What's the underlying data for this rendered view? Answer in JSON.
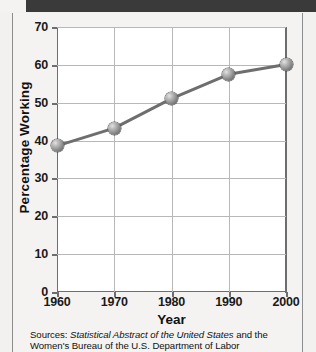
{
  "header": {
    "bar_color": "#3a3a3a"
  },
  "figure": {
    "background": "#f4f3f1",
    "plot_background": "#ffffff",
    "gridline_color": "#b8b8b8",
    "axis_color": "#6e6e6e",
    "series_color": "#6e6e6e",
    "marker_color": "#8f8f8f"
  },
  "source": {
    "prefix": "Sources: ",
    "italic_title": "Statistical Abstract of the United States",
    "suffix": " and the Women's Bureau of the U.S. Department of Labor"
  },
  "chart_data": {
    "type": "line",
    "title": "",
    "xlabel": "Year",
    "ylabel": "Percentage Working",
    "x": [
      1960,
      1970,
      1980,
      1990,
      2000
    ],
    "xticklabels": [
      "1960",
      "1970",
      "1980",
      "1990",
      "2000"
    ],
    "values": [
      38.6,
      43.3,
      51.1,
      57.5,
      60.1
    ],
    "yticks": [
      0,
      10,
      20,
      30,
      40,
      50,
      60,
      70
    ],
    "yticklabels": [
      "0",
      "10",
      "20",
      "30",
      "40",
      "50",
      "60",
      "70"
    ],
    "xlim": [
      1960,
      2000
    ],
    "ylim": [
      0,
      70
    ],
    "grid": true,
    "legend": false,
    "marker": "sphere",
    "series": [
      {
        "name": "Percentage Working",
        "values": [
          38.6,
          43.3,
          51.1,
          57.5,
          60.1
        ]
      }
    ]
  }
}
